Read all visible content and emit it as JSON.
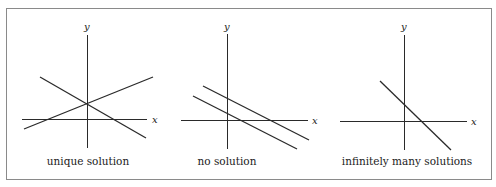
{
  "figure": {
    "frame": {
      "x": 6.5,
      "y": 8.5,
      "width": 485,
      "height": 171,
      "stroke": "#8a8a8a"
    },
    "line_color": "#2a2a2a",
    "panels": [
      {
        "id": "unique",
        "caption": "unique solution",
        "caption_x": 88,
        "x_axis": {
          "x1": 22,
          "x2": 147,
          "y": 119,
          "label": "x",
          "label_x": 152
        },
        "y_axis": {
          "x": 87,
          "y1": 35,
          "y2": 148,
          "label": "y",
          "label_y": 30
        },
        "lines": [
          {
            "x1": 24,
            "y1": 129,
            "x2": 153,
            "y2": 77
          },
          {
            "x1": 40,
            "y1": 77,
            "x2": 146,
            "y2": 138
          }
        ]
      },
      {
        "id": "none",
        "caption": "no solution",
        "caption_x": 227,
        "x_axis": {
          "x1": 181,
          "x2": 308,
          "y": 120,
          "label": "x",
          "label_x": 312
        },
        "y_axis": {
          "x": 227,
          "y1": 34,
          "y2": 149,
          "label": "y",
          "label_y": 30
        },
        "lines": [
          {
            "x1": 203,
            "y1": 86,
            "x2": 309,
            "y2": 140
          },
          {
            "x1": 193,
            "y1": 96,
            "x2": 297,
            "y2": 149
          }
        ]
      },
      {
        "id": "infinite",
        "caption": "infinitely many solutions",
        "caption_x": 407,
        "x_axis": {
          "x1": 340,
          "x2": 467,
          "y": 121,
          "label": "x",
          "label_x": 471
        },
        "y_axis": {
          "x": 404,
          "y1": 35,
          "y2": 150,
          "label": "y",
          "label_y": 30
        },
        "lines": [
          {
            "x1": 380,
            "y1": 81,
            "x2": 451,
            "y2": 150
          }
        ]
      }
    ]
  }
}
